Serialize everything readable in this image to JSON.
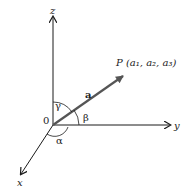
{
  "diagram": {
    "type": "3d-vector-direction-angles",
    "axes": {
      "x": "x",
      "y": "y",
      "z": "z"
    },
    "origin_label": "0",
    "vector_label": "a",
    "point_label": "P (a₁, a₂, a₃)",
    "angles": {
      "alpha": "α",
      "beta": "β",
      "gamma": "γ"
    },
    "colors": {
      "axis": "#1a1a1a",
      "vector": "#555555",
      "text": "#222222"
    }
  }
}
